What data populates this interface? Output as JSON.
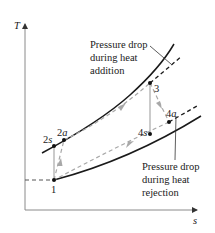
{
  "diagram": {
    "type": "T-s diagram",
    "axes": {
      "y_label": "T",
      "x_label": "s"
    },
    "states": {
      "p1": "1",
      "p2s_num": "2",
      "p2s_sub": "s",
      "p2a_num": "2",
      "p2a_sub": "a",
      "p3": "3",
      "p4s_num": "4",
      "p4s_sub": "s",
      "p4a_num": "4",
      "p4a_sub": "a"
    },
    "annotations": {
      "heat_addition": [
        "Pressure drop",
        "during heat",
        "addition"
      ],
      "heat_rejection": [
        "Pressure drop",
        "during heat",
        "rejection"
      ]
    },
    "colors": {
      "curve": "#1a1a1a",
      "process_path": "#a8a8a8",
      "axis": "#8a8a8a"
    }
  }
}
